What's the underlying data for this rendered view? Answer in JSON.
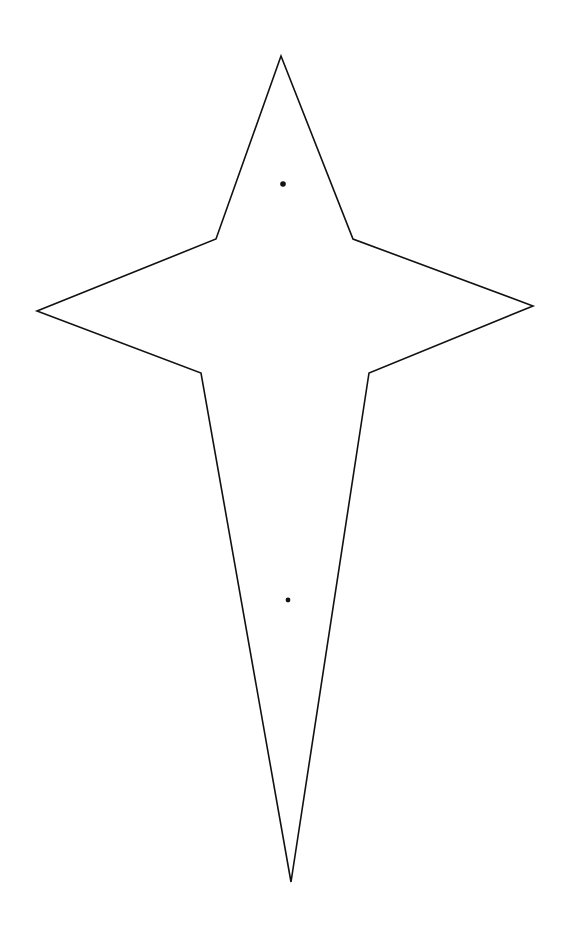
{
  "diagram": {
    "title": "",
    "background": "#ffffff",
    "stroke_color": "#111111",
    "fill_color": "#ffffff",
    "stroke_width": 1.6,
    "shape": {
      "name": "four-point-star-outline",
      "points": [
        [
          281,
          56
        ],
        [
          353,
          239
        ],
        [
          533,
          306
        ],
        [
          369,
          373
        ],
        [
          291,
          882
        ],
        [
          201,
          373
        ],
        [
          37,
          311
        ],
        [
          216,
          239
        ]
      ]
    },
    "dots": [
      {
        "name": "upper-dot",
        "cx": 283,
        "cy": 184,
        "r": 2.8
      },
      {
        "name": "lower-dot",
        "cx": 288,
        "cy": 600,
        "r": 2.4
      }
    ]
  }
}
